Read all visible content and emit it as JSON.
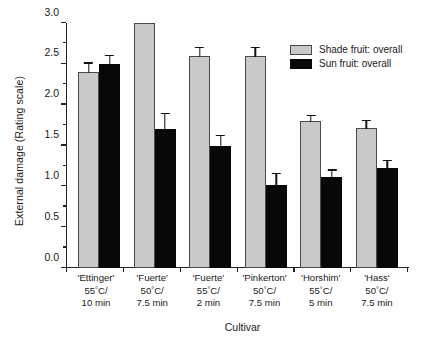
{
  "chart_data": {
    "type": "bar",
    "title": "",
    "xlabel": "Cultivar",
    "ylabel": "External damage (Rating scale)",
    "ylim": [
      0.0,
      3.0
    ],
    "ytick_labels": [
      "0.0",
      "0.5",
      "1.0",
      "1.5",
      "2.0",
      "2.5",
      "3.0"
    ],
    "ytick_values": [
      0.0,
      0.5,
      1.0,
      1.5,
      2.0,
      2.5,
      3.0
    ],
    "minor_tick_step": 0.25,
    "grid": false,
    "legend_position": "top-right",
    "categories": [
      "'Ettinger' 55°C/ 10 min",
      "'Fuerte' 50°C/ 7.5 min",
      "'Fuerte' 55°C/ 2 min",
      "'Pinkerton' 50°C/ 7.5 min",
      "'Horshim' 55°C/ 5 min",
      "'Hass' 50°C/ 7.5 min"
    ],
    "category_parts": [
      {
        "cultivar": "'Ettinger'",
        "temperature": "55°C/",
        "duration": "10 min"
      },
      {
        "cultivar": "'Fuerte'",
        "temperature": "50°C/",
        "duration": "7.5 min"
      },
      {
        "cultivar": "'Fuerte'",
        "temperature": "55°C/",
        "duration": "2 min"
      },
      {
        "cultivar": "'Pinkerton'",
        "temperature": "50°C/",
        "duration": "7.5 min"
      },
      {
        "cultivar": "'Horshim'",
        "temperature": "55°C/",
        "duration": "5 min"
      },
      {
        "cultivar": "'Hass'",
        "temperature": "50°C/",
        "duration": "7.5 min"
      }
    ],
    "series": [
      {
        "name": "Shade fruit: overall",
        "color": "#c9c9c9",
        "values": [
          2.4,
          3.0,
          2.6,
          2.6,
          1.8,
          1.72
        ],
        "errors": [
          0.13,
          0.0,
          0.12,
          0.12,
          0.09,
          0.11
        ]
      },
      {
        "name": "Sun fruit: overall",
        "color": "#080808",
        "values": [
          2.5,
          1.7,
          1.5,
          1.02,
          1.12,
          1.22
        ],
        "errors": [
          0.12,
          0.21,
          0.14,
          0.16,
          0.1,
          0.12
        ]
      }
    ]
  },
  "legend": {
    "entries": [
      {
        "label": "Shade fruit: overall",
        "swatch": "shade"
      },
      {
        "label": "Sun fruit: overall",
        "swatch": "sun"
      }
    ]
  }
}
